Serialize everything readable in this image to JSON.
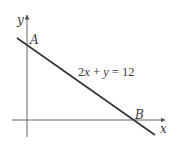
{
  "diagram": {
    "axes": {
      "x_label": "x",
      "y_label": "y"
    },
    "points": {
      "a_label": "A",
      "b_label": "B"
    },
    "line": {
      "equation_parts": [
        "2",
        "x",
        " + ",
        "y",
        " = 12"
      ],
      "equation": "2x + y = 12"
    },
    "colors": {
      "axis": "#555555",
      "line": "#333333",
      "text": "#3a3a3a",
      "background": "#ffffff"
    }
  }
}
